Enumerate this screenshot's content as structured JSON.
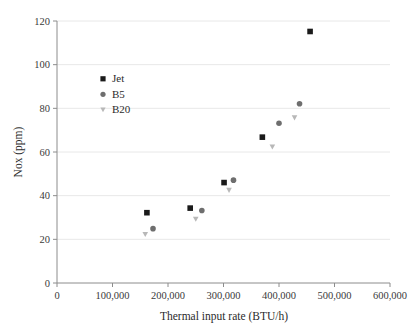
{
  "chart_data": {
    "type": "scatter",
    "title": "",
    "xlabel": "Thermal input rate (BTU/h)",
    "ylabel": "Nox (ppm)",
    "xlim": [
      0,
      600000
    ],
    "ylim": [
      0,
      120
    ],
    "xticks": [
      0,
      100000,
      200000,
      300000,
      400000,
      500000,
      600000
    ],
    "xtick_labels": [
      "0",
      "100,000",
      "200,000",
      "300,000",
      "400,000",
      "500,000",
      "600,000"
    ],
    "yticks": [
      0,
      20,
      40,
      60,
      80,
      100,
      120
    ],
    "ytick_labels": [
      "0",
      "20",
      "40",
      "60",
      "80",
      "100",
      "120"
    ],
    "grid": "horizontal",
    "legend_position": "upper-left-inside",
    "series": [
      {
        "name": "Jet",
        "marker": "square",
        "color": "#1a1a1a",
        "points": [
          {
            "x": 162000,
            "y": 32.2
          },
          {
            "x": 240000,
            "y": 34.3
          },
          {
            "x": 301000,
            "y": 46.0
          },
          {
            "x": 370000,
            "y": 66.8
          },
          {
            "x": 456000,
            "y": 115.2
          }
        ]
      },
      {
        "name": "B5",
        "marker": "circle",
        "color": "#6e6e6e",
        "points": [
          {
            "x": 173000,
            "y": 24.9
          },
          {
            "x": 261000,
            "y": 33.2
          },
          {
            "x": 318000,
            "y": 47.1
          },
          {
            "x": 400000,
            "y": 73.2
          },
          {
            "x": 437000,
            "y": 82.1
          }
        ]
      },
      {
        "name": "B20",
        "marker": "triangle-down",
        "color": "#b8b8b8",
        "points": [
          {
            "x": 159000,
            "y": 22.2
          },
          {
            "x": 250000,
            "y": 29.2
          },
          {
            "x": 310000,
            "y": 42.4
          },
          {
            "x": 388000,
            "y": 62.3
          },
          {
            "x": 428000,
            "y": 75.6
          }
        ]
      }
    ]
  },
  "legend": {
    "items": [
      {
        "label": "Jet"
      },
      {
        "label": "B5"
      },
      {
        "label": "B20"
      }
    ]
  },
  "colors": {
    "axis": "#8c8c8c",
    "grid": "#e8e8e8",
    "text": "#2b2b2b",
    "jet": "#1a1a1a",
    "b5": "#6e6e6e",
    "b20": "#b8b8b8",
    "background": "#ffffff"
  }
}
